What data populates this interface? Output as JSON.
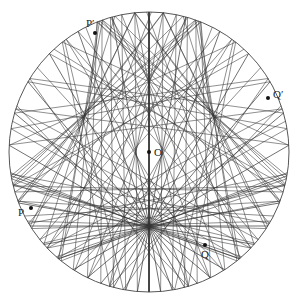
{
  "diagram": {
    "type": "caustic-circle-chords",
    "circle": {
      "cx": 149,
      "cy": 152,
      "r": 140
    },
    "focus": {
      "x": 149,
      "y": 226
    },
    "ray_count": 36,
    "line_color": "#333333",
    "points": [
      {
        "id": "O",
        "label": "O",
        "x": 149,
        "y": 152,
        "lx": 154,
        "ly": 156
      },
      {
        "id": "P",
        "label": "P",
        "x": 31,
        "y": 208,
        "lx": 18,
        "ly": 216
      },
      {
        "id": "P_prime",
        "label": "P′",
        "x": 95,
        "y": 33,
        "lx": 86,
        "ly": 27
      },
      {
        "id": "Q",
        "label": "Q",
        "x": 205,
        "y": 245,
        "lx": 201,
        "ly": 258
      },
      {
        "id": "Q_prime",
        "label": "Q′",
        "x": 268,
        "y": 98,
        "lx": 273,
        "ly": 98
      }
    ]
  }
}
